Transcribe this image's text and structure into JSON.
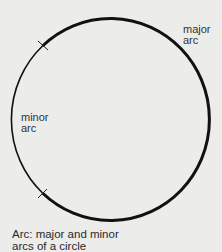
{
  "diagram": {
    "labels": {
      "major_line1": "major",
      "major_line2": "arc",
      "minor_line1": "minor",
      "minor_line2": "arc"
    },
    "caption": {
      "line1": "Arc: major and minor",
      "line2": "arcs of a circle"
    },
    "colors": {
      "background": "#ececea",
      "stroke": "#111111"
    }
  }
}
